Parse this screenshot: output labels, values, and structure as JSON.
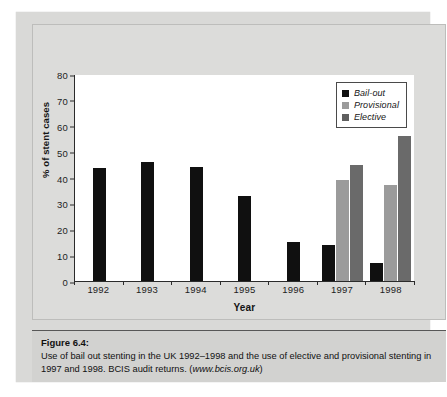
{
  "figure": {
    "caption_title": "Figure 6.4:",
    "caption_line1": "Use of bail out stenting in the UK 1992–1998 and the use of elective and provisional stenting in",
    "caption_line2_pre": "1997 and 1998. BCIS audit returns. (",
    "caption_url": "www.bcis.org.uk",
    "caption_line2_post": ")"
  },
  "colors": {
    "bailout": "#101010",
    "provisional": "#9b9b9b",
    "elective": "#6a6a6a",
    "axis": "#2b2b2b",
    "plot_background": "#ffffff",
    "card_background": "#dcdcda",
    "caption_background": "#d2d2d0"
  },
  "chart_data": {
    "type": "bar",
    "title": "",
    "xlabel": "Year",
    "ylabel": "% of stent cases",
    "categories": [
      "1992",
      "1993",
      "1994",
      "1995",
      "1996",
      "1997",
      "1998"
    ],
    "series": [
      {
        "name": "Bail-out",
        "values": [
          43.5,
          46,
          44,
          33,
          15,
          14,
          7
        ]
      },
      {
        "name": "Provisional",
        "values": [
          null,
          null,
          null,
          null,
          null,
          39,
          37
        ]
      },
      {
        "name": "Elective",
        "values": [
          null,
          null,
          null,
          null,
          null,
          45,
          56
        ]
      }
    ],
    "ylim": [
      0,
      80
    ],
    "yticks": [
      80,
      70,
      60,
      50,
      40,
      30,
      20,
      10,
      0
    ],
    "grid": false,
    "legend_position": "top-right",
    "legend_entries": [
      "Bail-out",
      "Provisional",
      "Elective"
    ]
  }
}
